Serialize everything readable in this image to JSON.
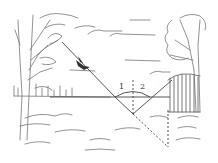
{
  "diagram": {
    "labels": {
      "angle1": "1",
      "angle2": "2"
    },
    "elements": {
      "left_tree": "bare tree with leafy clumps",
      "right_tree": "leafy tree behind fence",
      "bird": "bird in flight on diagonal line",
      "fence": "wooden picket fence",
      "horizon": "horizontal line",
      "vertex": "reflection point below horizon"
    },
    "colors": {
      "line": "#444444",
      "sketch": "#777777",
      "background": "#ffffff"
    }
  }
}
